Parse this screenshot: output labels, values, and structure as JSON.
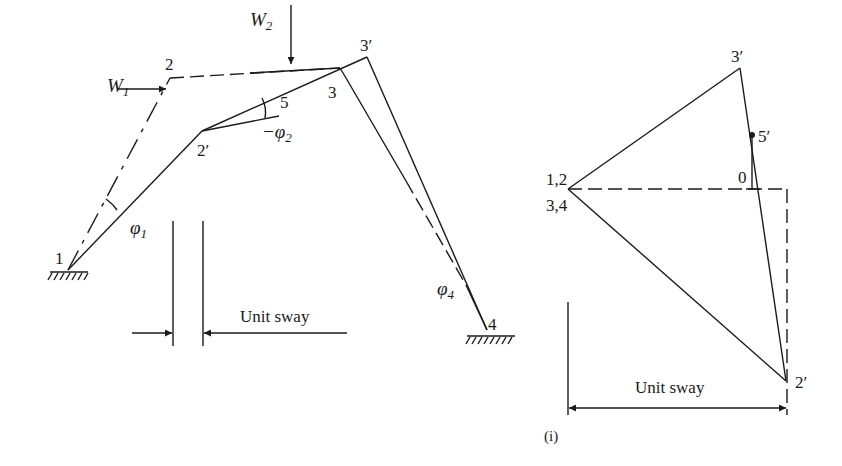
{
  "left_frame": {
    "loads": {
      "w1": "W",
      "w1_sub": "1",
      "w2": "W",
      "w2_sub": "2"
    },
    "nodes": {
      "n1": "1",
      "n2": "2",
      "n2p": "2′",
      "n3": "3",
      "n3p": "3′",
      "n4": "4",
      "n5": "5"
    },
    "angles": {
      "phi1": "φ",
      "phi1_sub": "1",
      "phi2": "−φ",
      "phi2_sub": "2",
      "phi4": "φ",
      "phi4_sub": "4"
    },
    "sway_label": "Unit sway"
  },
  "displacement_diagram": {
    "nodes": {
      "origin_top": "1,2",
      "origin_bottom": "3,4",
      "n3p": "3′",
      "n5p": "5′",
      "n2p": "2′",
      "zero": "0"
    },
    "sway_label": "Unit sway",
    "caption": "(i)"
  },
  "colors": {
    "ink": "#1a1a1a",
    "background": "#ffffff"
  }
}
